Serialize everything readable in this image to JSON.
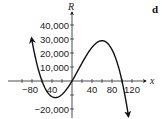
{
  "panel_label": "d",
  "chart_data": {
    "type": "line",
    "title": "",
    "xlabel": "x",
    "ylabel": "R",
    "xlim": [
      -100,
      130
    ],
    "ylim": [
      -22000,
      45000
    ],
    "x_ticks": [
      -80,
      -40,
      40,
      80,
      120
    ],
    "x_tick_labels": [
      "−80",
      "40",
      "40",
      "80",
      "120"
    ],
    "x_minor_ticks": [
      -100,
      -80,
      -60,
      -40,
      -20,
      20,
      40,
      60,
      80,
      100,
      120
    ],
    "y_ticks": [
      40000,
      30000,
      20000,
      10000,
      -20000
    ],
    "y_tick_labels": [
      "40,000",
      "30,000",
      "20,000",
      "10,000",
      "−20,000"
    ],
    "y_minor_ticks": [
      -10000
    ],
    "grid": false,
    "legend": null,
    "series": [
      {
        "name": "R(x)",
        "description": "Cubic curve with roots near x = -60, 0, 100; local min about (-35, -12000), local max about (58, 29000); arrows at both ends",
        "x": [
          -82,
          -75,
          -70,
          -60,
          -50,
          -40,
          -35,
          -30,
          -20,
          -10,
          0,
          10,
          20,
          30,
          40,
          50,
          58,
          65,
          70,
          80,
          90,
          100,
          110,
          114
        ],
        "values": [
          44700,
          30800,
          21700,
          0,
          -8300,
          -12600,
          -11800,
          -11700,
          -9600,
          -5900,
          0,
          6300,
          12800,
          18900,
          23600,
          27500,
          28700,
          28800,
          27300,
          22400,
          13500,
          0,
          -18700,
          -27400
        ]
      }
    ]
  }
}
